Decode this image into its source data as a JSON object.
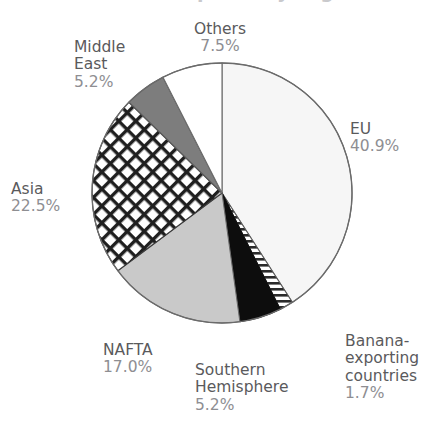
{
  "figure": {
    "background": "#ffffff",
    "width": 432,
    "height": 422,
    "clipped_title_remnant": "World banana imports by region"
  },
  "chart_data": {
    "type": "pie",
    "title": "",
    "xlabel": "",
    "ylabel": "",
    "legend": "none (direct labels around slices)",
    "grid": false,
    "total_percent": 100.0,
    "start_angle_deg": 90,
    "direction": "clockwise",
    "center_px": [
      222,
      193
    ],
    "radius_px": 130,
    "categories": [
      "EU",
      "Banana-exporting countries",
      "Southern Hemisphere",
      "NAFTA",
      "Asia",
      "Middle East",
      "Others"
    ],
    "values": [
      40.9,
      1.7,
      5.2,
      17.0,
      22.5,
      5.2,
      7.5
    ],
    "labels": [
      "40.9%",
      "1.7%",
      "5.2%",
      "17.0%",
      "22.5%",
      "5.2%",
      "7.5%"
    ],
    "slices": [
      {
        "name": "EU",
        "value": 40.9,
        "label": "40.9%",
        "fill": "#f6f6f6",
        "pattern": "solid",
        "stroke": "#6b6b6b"
      },
      {
        "name": "Banana-exporting countries",
        "value": 1.7,
        "label": "1.7%",
        "fill": "#ffffff",
        "pattern": "horizontal-stripes",
        "stroke": "#5a5a5a"
      },
      {
        "name": "Southern Hemisphere",
        "value": 5.2,
        "label": "5.2%",
        "fill": "#0d0d0d",
        "pattern": "solid",
        "stroke": "#0d0d0d"
      },
      {
        "name": "NAFTA",
        "value": 17.0,
        "label": "17.0%",
        "fill": "#c9c9c9",
        "pattern": "solid",
        "stroke": "#6b6b6b"
      },
      {
        "name": "Asia",
        "value": 22.5,
        "label": "22.5%",
        "fill": "#ffffff",
        "pattern": "diagonal-crosshatch",
        "stroke": "#3a3a3a"
      },
      {
        "name": "Middle East",
        "value": 5.2,
        "label": "5.2%",
        "fill": "#7d7d7d",
        "pattern": "solid",
        "stroke": "#5a5a5a"
      },
      {
        "name": "Others",
        "value": 7.5,
        "label": "7.5%",
        "fill": "#ffffff",
        "pattern": "solid",
        "stroke": "#6b6b6b"
      }
    ],
    "colors": {
      "label_name": "#5a5a5c",
      "label_percent": "#8e8e92",
      "outline": "#6b6b6b",
      "background": "#ffffff"
    }
  },
  "labels": {
    "others": {
      "name": "Others",
      "pct": "7.5%"
    },
    "middle_east": {
      "name": "Middle\nEast",
      "pct": "5.2%"
    },
    "asia": {
      "name": "Asia",
      "pct": "22.5%"
    },
    "eu": {
      "name": "EU",
      "pct": "40.9%"
    },
    "banana": {
      "name": "Banana-\nexporting\ncountries",
      "pct": "1.7%"
    },
    "southern": {
      "name": "Southern\nHemisphere",
      "pct": "5.2%"
    },
    "nafta": {
      "name": "NAFTA",
      "pct": "17.0%"
    }
  }
}
